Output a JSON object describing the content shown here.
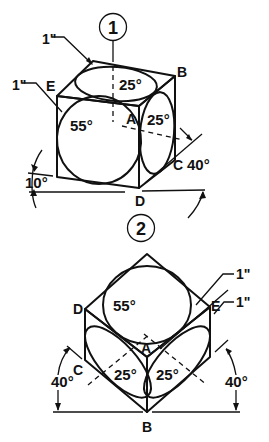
{
  "figure1": {
    "number": "1",
    "labels": {
      "B": "B",
      "E": "E",
      "A": "A",
      "C": "C",
      "D": "D"
    },
    "angles": {
      "top_face": "25°",
      "left_face": "55°",
      "right_face": "25°",
      "right_rotation": "40°",
      "left_tilt": "10°"
    },
    "dims": {
      "top": "1\"",
      "left": "1\""
    }
  },
  "figure2": {
    "number": "2",
    "labels": {
      "D": "D",
      "E": "E",
      "A": "A",
      "C": "C",
      "B": "B"
    },
    "angles": {
      "top_face": "55°",
      "lower_left_face": "25°",
      "lower_right_face": "25°",
      "left_rotation": "40°",
      "right_rotation": "40°"
    },
    "dims": {
      "upper": "1\"",
      "lower": "1\""
    }
  },
  "colors": {
    "ink": "#111111",
    "paper": "#ffffff"
  }
}
